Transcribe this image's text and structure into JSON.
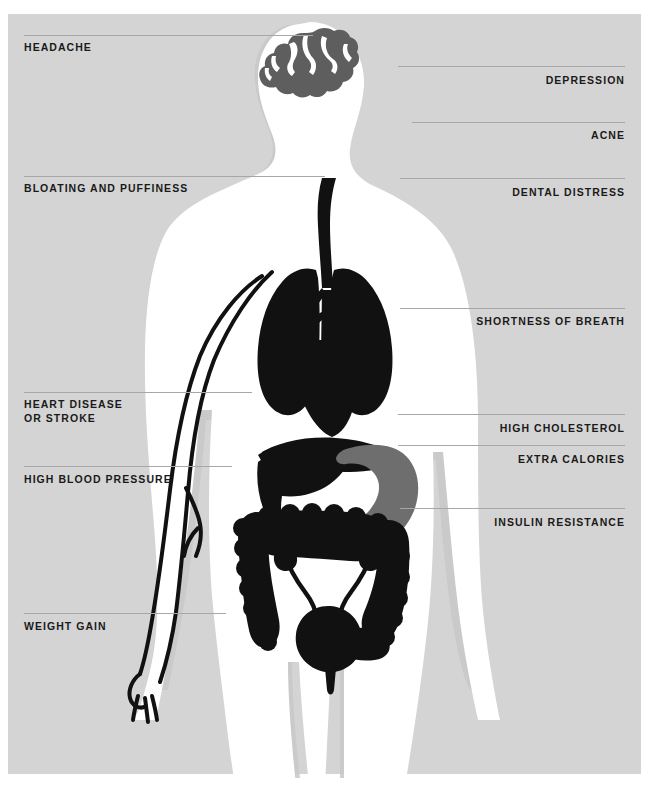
{
  "diagram": {
    "type": "annotated-anatomy-illustration",
    "colors": {
      "background": "#ffffff",
      "panel": "#d4d4d4",
      "body_silhouette": "#ffffff",
      "body_shadow": "#c8c8c8",
      "organ_dark": "#111111",
      "organ_mid": "#6e6e6e",
      "brain": "#5e5e5e",
      "leader_line": "#a7a7a7",
      "label_text": "#1a1a1a"
    },
    "left_labels": [
      {
        "text": "HEADACHE",
        "x": 24,
        "y": 41,
        "line_y": 35,
        "line_x1": 24,
        "line_x2": 313
      },
      {
        "text": "BLOATING AND PUFFINESS",
        "x": 24,
        "y": 182,
        "line_y": 176,
        "line_x1": 24,
        "line_x2": 325
      },
      {
        "text": "HEART DISEASE\nOR STROKE",
        "x": 24,
        "y": 398,
        "line_y": 392,
        "line_x1": 24,
        "line_x2": 252
      },
      {
        "text": "HIGH BLOOD PRESSURE",
        "x": 24,
        "y": 473,
        "line_y": 466,
        "line_x1": 24,
        "line_x2": 232
      },
      {
        "text": "WEIGHT GAIN",
        "x": 24,
        "y": 620,
        "line_y": 613,
        "line_x1": 24,
        "line_x2": 226
      }
    ],
    "right_labels": [
      {
        "text": "DEPRESSION",
        "x_right": 24,
        "y": 74,
        "line_y": 66,
        "line_x1": 398,
        "line_x2": 625
      },
      {
        "text": "ACNE",
        "x_right": 24,
        "y": 129,
        "line_y": 122,
        "line_x1": 412,
        "line_x2": 625
      },
      {
        "text": "DENTAL DISTRESS",
        "x_right": 24,
        "y": 186,
        "line_y": 178,
        "line_x1": 400,
        "line_x2": 625
      },
      {
        "text": "SHORTNESS OF BREATH",
        "x_right": 24,
        "y": 315,
        "line_y": 308,
        "line_x1": 400,
        "line_x2": 625
      },
      {
        "text": "HIGH CHOLESTEROL",
        "x_right": 24,
        "y": 422,
        "line_y": 414,
        "line_x1": 398,
        "line_x2": 625
      },
      {
        "text": "EXTRA CALORIES",
        "x_right": 24,
        "y": 453,
        "line_y": 445,
        "line_x1": 398,
        "line_x2": 625
      },
      {
        "text": "INSULIN RESISTANCE",
        "x_right": 24,
        "y": 516,
        "line_y": 508,
        "line_x1": 400,
        "line_x2": 625
      }
    ],
    "anatomy_parts": [
      "brain",
      "head",
      "trachea",
      "lungs",
      "heart",
      "liver",
      "stomach",
      "large-intestine",
      "kidneys",
      "ureters",
      "bladder",
      "arm-blood-vessels",
      "body-silhouette"
    ]
  }
}
